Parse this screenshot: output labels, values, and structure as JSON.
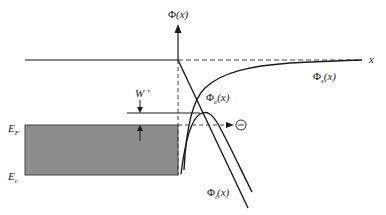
{
  "diagram": {
    "colors": {
      "line": "#1a1a1a",
      "metal_fill": "#8c8c8c",
      "dash": "#444444",
      "background": "#ffffff"
    },
    "axis": {
      "y_label_main": "Φ",
      "y_label_arg": "(x)",
      "x_label": "x"
    },
    "curves": {
      "phi_s": {
        "main": "Φ",
        "sub": "s",
        "arg": "(x)"
      },
      "phi_e": {
        "main": "Φ",
        "sub": "e",
        "arg": "(x)"
      },
      "phi_i": {
        "main": "Φ",
        "sub": "i",
        "arg": "(x)"
      }
    },
    "levels": {
      "fermi": {
        "main": "E",
        "sub": "F"
      },
      "conduction": {
        "main": "E",
        "sub": "c"
      }
    },
    "annotations": {
      "barrier_lowering": "W '",
      "electron_symbol": "⊖"
    }
  }
}
